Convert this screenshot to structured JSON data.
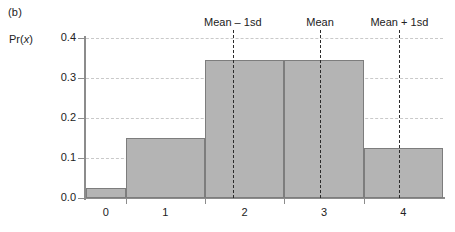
{
  "panel": {
    "label": "(b)"
  },
  "chart_data": {
    "type": "bar",
    "title": "",
    "subtitle": "",
    "xlabel": "",
    "ylabel": "Pr(x)",
    "ylabel_parts": {
      "prefix": "Pr(",
      "italic": "x",
      "suffix": ")"
    },
    "categories": [
      "0",
      "1",
      "2",
      "3",
      "4"
    ],
    "values": [
      0.025,
      0.15,
      0.345,
      0.345,
      0.125
    ],
    "ylim": [
      0.0,
      0.4
    ],
    "ytick_labels": [
      "0.0",
      "0.1",
      "0.2",
      "0.3",
      "0.4"
    ],
    "ytick_values": [
      0.0,
      0.1,
      0.2,
      0.3,
      0.4
    ],
    "xtick_labels": [
      "0",
      "1",
      "2",
      "3",
      "4"
    ],
    "grid": true,
    "grid_axis": "y",
    "grid_style": "dashed",
    "legend": "none",
    "bar_fill_color": "#b4b4b4",
    "bar_edge_color": "#7d7d7d",
    "grid_color": "#c9c9c9",
    "axis_color": "#8c8c8c",
    "annotations": [
      {
        "label": "Mean – 1sd",
        "x_value": 1.35,
        "style": "dashed-vertical"
      },
      {
        "label": "Mean",
        "x_value": 2.45,
        "style": "dashed-vertical"
      },
      {
        "label": "Mean + 1sd",
        "x_value": 3.45,
        "style": "dashed-vertical"
      }
    ]
  }
}
